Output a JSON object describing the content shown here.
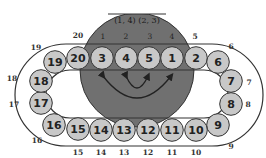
{
  "diagram": {
    "disk_title": "(1, 4) (2, 3)",
    "disk_slot_labels": [
      "1",
      "2",
      "3",
      "4"
    ],
    "colors": {
      "disk": "#707070",
      "ball": "#c8c8c8",
      "outline": "#333333"
    },
    "balls": [
      {
        "label": "20"
      },
      {
        "label": "3"
      },
      {
        "label": "4"
      },
      {
        "label": "5"
      },
      {
        "label": "1"
      },
      {
        "label": "2"
      },
      {
        "label": "6"
      },
      {
        "label": "7"
      },
      {
        "label": "8"
      },
      {
        "label": "9"
      },
      {
        "label": "10"
      },
      {
        "label": "11"
      },
      {
        "label": "12"
      },
      {
        "label": "13"
      },
      {
        "label": "14"
      },
      {
        "label": "15"
      },
      {
        "label": "16"
      },
      {
        "label": "17"
      },
      {
        "label": "18"
      },
      {
        "label": "19"
      }
    ],
    "position_labels": [
      {
        "label": "20"
      },
      {
        "label": "5"
      },
      {
        "label": "6"
      },
      {
        "label": "7"
      },
      {
        "label": "8"
      },
      {
        "label": "9"
      },
      {
        "label": "10"
      },
      {
        "label": "11"
      },
      {
        "label": "12"
      },
      {
        "label": "13"
      },
      {
        "label": "14"
      },
      {
        "label": "15"
      },
      {
        "label": "16"
      },
      {
        "label": "17"
      },
      {
        "label": "18"
      },
      {
        "label": "19"
      }
    ],
    "arrows": [
      {
        "from_slot": "1",
        "to_slot": "4"
      },
      {
        "from_slot": "2",
        "to_slot": "3"
      }
    ]
  }
}
